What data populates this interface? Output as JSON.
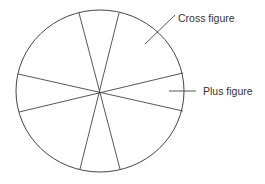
{
  "diagram": {
    "type": "circle-sectors",
    "colors": {
      "stroke": "#444444",
      "text": "#333333",
      "background": "#ffffff"
    },
    "circle": {
      "cx": 100,
      "cy": 91,
      "rx": 84,
      "ry": 81
    },
    "spokes": [
      {
        "x1": 79,
        "y1": 13,
        "x2": 120,
        "y2": 169
      },
      {
        "x1": 119,
        "y1": 13,
        "x2": 80,
        "y2": 169
      },
      {
        "x1": 18,
        "y1": 74,
        "x2": 183,
        "y2": 111
      },
      {
        "x1": 19,
        "y1": 112,
        "x2": 183,
        "y2": 73
      }
    ],
    "labels": [
      {
        "id": "cross",
        "text": "Cross figure",
        "x": 178,
        "y": 22,
        "leader": {
          "x1": 145,
          "y1": 44,
          "x2": 175,
          "y2": 15
        }
      },
      {
        "id": "plus",
        "text": "Plus figure",
        "x": 203,
        "y": 95,
        "leader": {
          "x1": 169,
          "y1": 91,
          "x2": 196,
          "y2": 91
        }
      }
    ]
  }
}
